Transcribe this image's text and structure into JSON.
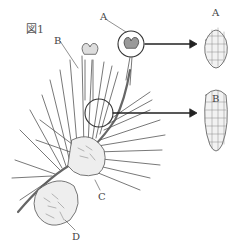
{
  "figure": {
    "title": "図1",
    "labels": {
      "A": "A",
      "B": "B",
      "C": "C",
      "D": "D"
    },
    "enlarged": [
      {
        "label": "A"
      },
      {
        "label": "B"
      }
    ]
  }
}
